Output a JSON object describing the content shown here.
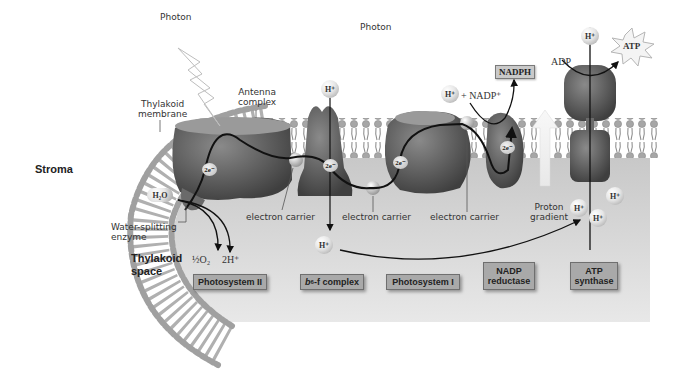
{
  "diagram": {
    "regions": {
      "stroma": "Stroma",
      "thylakoid_space_line1": "Thylakoid",
      "thylakoid_space_line2": "space"
    },
    "photons": [
      {
        "label": "Photon"
      },
      {
        "label": "Photon"
      }
    ],
    "annotations": {
      "thylakoid_membrane_line1": "Thylakoid",
      "thylakoid_membrane_line2": "membrane",
      "antenna_complex_line1": "Antenna",
      "antenna_complex_line2": "complex",
      "water_splitting_line1": "Water-splitting",
      "water_splitting_line2": "enzyme",
      "electron_carriers": [
        "electron carrier",
        "electron carrier",
        "electron carrier"
      ],
      "proton_gradient_line1": "Proton",
      "proton_gradient_line2": "gradient"
    },
    "molecules": {
      "water": "H₂O",
      "oxygen": "½O₂",
      "two_h": "2H⁺",
      "h_plus": "H⁺",
      "nadp_plus": "+ NADP⁺",
      "nadph": "NADPH",
      "adp": "ADP",
      "atp": "ATP",
      "two_e": "2e⁻"
    },
    "complexes": [
      {
        "label": "Photosystem II"
      },
      {
        "label_prefix": "b",
        "label_sub": "6",
        "label_suffix": "-f complex"
      },
      {
        "label": "Photosystem I"
      },
      {
        "label_line1": "NADP",
        "label_line2": "reductase"
      },
      {
        "label_line1": "ATP",
        "label_line2": "synthase"
      }
    ],
    "colors": {
      "lumen": "#d4d4d4",
      "membrane_head": "#a8a8a8",
      "protein_dark": "#5a5a5a",
      "label_box": "#a9a9a9",
      "arrow": "#111111"
    }
  }
}
